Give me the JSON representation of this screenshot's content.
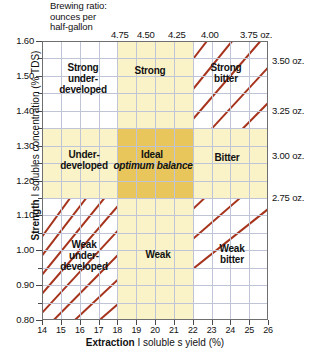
{
  "header": {
    "brewing_ratio_caption": "Brewing ratio:\nounces per\nhalf-gallon"
  },
  "axes": {
    "x_title_bold": "Extraction",
    "x_title_rest": " I soluble s yield (%)",
    "x_title_full": "Extraction I solubles yield (%)",
    "y_title_bold": "Strength",
    "y_title_rest": " I solubles concentration (% TDS)",
    "y_title_full": "Strength I solubles concentration (% TDS)"
  },
  "chart_data": {
    "type": "line",
    "xlabel": "Extraction I solubles yield (%)",
    "ylabel": "Strength I solubles concentration (% TDS)",
    "xlim": [
      14,
      26
    ],
    "ylim": [
      0.8,
      1.6
    ],
    "grid": true,
    "legend_position": "none",
    "x_ticks": [
      14,
      15,
      16,
      17,
      18,
      19,
      20,
      21,
      22,
      23,
      24,
      25,
      26
    ],
    "x_tick_labels": [
      "14",
      "15",
      "16",
      "17",
      "18",
      "19",
      "20",
      "21",
      "22",
      "23",
      "24",
      "25",
      "26"
    ],
    "y_ticks": [
      0.8,
      0.9,
      1.0,
      1.1,
      1.2,
      1.3,
      1.4,
      1.5,
      1.6
    ],
    "y_tick_labels": [
      "0.80",
      "0.90",
      "1.00",
      "1.10",
      "1.20",
      "1.30",
      "1.40",
      "1.50",
      "1.60"
    ],
    "y_minor_step": 0.05,
    "line_color": "#a6331c",
    "ideal_band_color": "#fbf3c8",
    "ideal_core_color": "#e8c65c",
    "grid_color": "#bfc4d6",
    "frame_color": "#6f6f72",
    "series": [
      {
        "name": "4.75 oz.",
        "label": "4.75",
        "label_position": "top",
        "ratio_oz_per_half_gallon": 4.75,
        "slope_tds_per_pct": 0.0742
      },
      {
        "name": "4.50 oz.",
        "label": "4.50",
        "label_position": "top",
        "ratio_oz_per_half_gallon": 4.5,
        "slope_tds_per_pct": 0.0703
      },
      {
        "name": "4.25 oz.",
        "label": "4.25",
        "label_position": "top",
        "ratio_oz_per_half_gallon": 4.25,
        "slope_tds_per_pct": 0.0664
      },
      {
        "name": "4.00 oz.",
        "label": "4.00",
        "label_position": "top",
        "ratio_oz_per_half_gallon": 4.0,
        "slope_tds_per_pct": 0.0625
      },
      {
        "name": "3.75 oz.",
        "label": "3.75 oz.",
        "label_position": "top",
        "ratio_oz_per_half_gallon": 3.75,
        "slope_tds_per_pct": 0.0586
      },
      {
        "name": "3.50 oz.",
        "label": "3.50 oz.",
        "label_position": "right",
        "ratio_oz_per_half_gallon": 3.5,
        "slope_tds_per_pct": 0.0547
      },
      {
        "name": "3.25 oz.",
        "label": "3.25 oz.",
        "label_position": "right",
        "ratio_oz_per_half_gallon": 3.25,
        "slope_tds_per_pct": 0.0508
      },
      {
        "name": "3.00 oz.",
        "label": "3.00 oz.",
        "label_position": "right",
        "ratio_oz_per_half_gallon": 3.0,
        "slope_tds_per_pct": 0.0469
      },
      {
        "name": "2.75 oz.",
        "label": "2.75 oz.",
        "label_position": "right",
        "ratio_oz_per_half_gallon": 2.75,
        "slope_tds_per_pct": 0.043
      }
    ],
    "ideal_region": {
      "extraction_range": [
        18,
        22
      ],
      "strength_range": [
        1.15,
        1.35
      ]
    },
    "zones": [
      {
        "id": "strong-underdeveloped",
        "label": "Strong\nunder-\ndeveloped"
      },
      {
        "id": "strong",
        "label": "Strong"
      },
      {
        "id": "strong-bitter",
        "label": "Strong\nbitter"
      },
      {
        "id": "underdeveloped",
        "label": "Under-\ndeveloped"
      },
      {
        "id": "ideal",
        "label": "Ideal"
      },
      {
        "id": "ideal-sub",
        "label": "optimum balance"
      },
      {
        "id": "bitter",
        "label": "Bitter"
      },
      {
        "id": "weak-underdeveloped",
        "label": "Weak\nunder-\ndeveloped"
      },
      {
        "id": "weak",
        "label": "Weak"
      },
      {
        "id": "weak-bitter",
        "label": "Weak\nbitter"
      }
    ]
  },
  "top_labels": [
    "4.75",
    "4.50",
    "4.25",
    "4.00",
    "3.75 oz."
  ],
  "right_labels": [
    "3.50 oz.",
    "3.25 oz.",
    "3.00 oz.",
    "2.75 oz."
  ]
}
